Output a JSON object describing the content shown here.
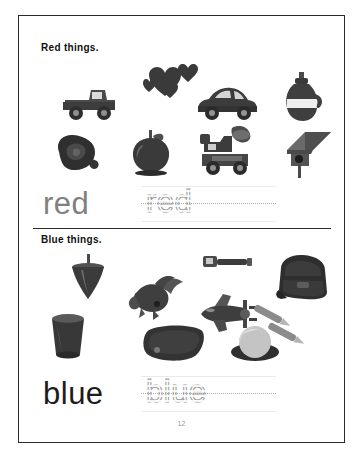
{
  "page": {
    "number": "12",
    "border_color": "#2a2a2a"
  },
  "sections": [
    {
      "id": "red",
      "heading_word": "Red",
      "heading_rest": "things.",
      "word": "red",
      "trace_word": "red",
      "word_color": "#808080",
      "pictures": [
        {
          "name": "truck",
          "label": "truck"
        },
        {
          "name": "hearts",
          "label": "hearts"
        },
        {
          "name": "car",
          "label": "car"
        },
        {
          "name": "bottle",
          "label": "bottle"
        },
        {
          "name": "rose",
          "label": "rose"
        },
        {
          "name": "apple",
          "label": "apple"
        },
        {
          "name": "fire-engine",
          "label": "fire engine"
        },
        {
          "name": "birdhouse",
          "label": "birdhouse"
        }
      ]
    },
    {
      "id": "blue",
      "heading_word": "Blue",
      "heading_rest": "things.",
      "word": "blue",
      "trace_word": "blue",
      "word_color": "#1c1c1c",
      "pictures": [
        {
          "name": "spinning-top",
          "label": "spinning top"
        },
        {
          "name": "bird",
          "label": "bird"
        },
        {
          "name": "flashlight",
          "label": "flashlight"
        },
        {
          "name": "airplane",
          "label": "airplane"
        },
        {
          "name": "backpack",
          "label": "backpack"
        },
        {
          "name": "crayons",
          "label": "crayons"
        },
        {
          "name": "cup",
          "label": "cup"
        },
        {
          "name": "mat",
          "label": "mat"
        },
        {
          "name": "ball",
          "label": "ball"
        }
      ]
    }
  ]
}
